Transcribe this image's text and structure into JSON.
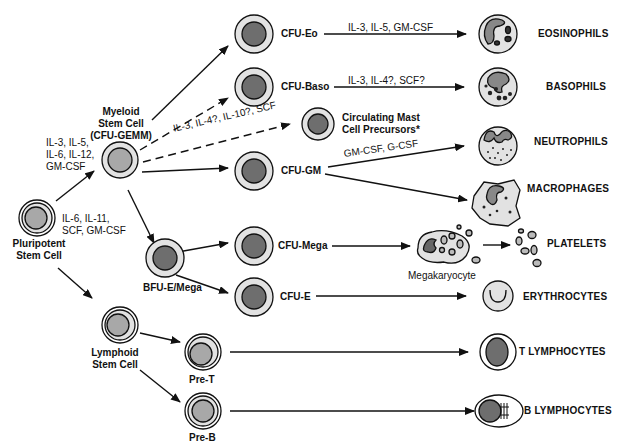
{
  "diagram": {
    "nodes": {
      "pluripotent": "Pluripotent\nStem Cell",
      "myeloid": "Myeloid\nStem Cell\n(CFU-GEMM)",
      "lymphoid": "Lymphoid\nStem Cell",
      "cfu_eo": "CFU-Eo",
      "cfu_baso": "CFU-Baso",
      "mast": "Circulating Mast\nCell Precursors*",
      "cfu_gm": "CFU-GM",
      "bfu_e_mega": "BFU-E/Mega",
      "cfu_mega": "CFU-Mega",
      "cfu_e": "CFU-E",
      "pre_t": "Pre-T",
      "pre_b": "Pre-B",
      "megakaryocyte": "Megakaryocyte"
    },
    "cytokines": {
      "to_myeloid": "IL-3, IL-5,\nIL-6, IL-12,\nGM-CSF",
      "pluripotent": "IL-6, IL-11,\nSCF, GM-CSF",
      "eo": "IL-3, IL-5, GM-CSF",
      "baso": "IL-3, IL-4?, SCF?",
      "mast": "IL-3, IL-4?, IL-10?, SCF",
      "gm": "GM-CSF, G-CSF"
    },
    "mature": {
      "eosinophils": "EOSINOPHILS",
      "basophils": "BASOPHILS",
      "neutrophils": "NEUTROPHILS",
      "macrophages": "MACROPHAGES",
      "platelets": "PLATELETS",
      "erythrocytes": "ERYTHROCYTES",
      "t_lymphocytes": "T LYMPHOCYTES",
      "b_lymphocytes": "B LYMPHOCYTES"
    },
    "colors": {
      "outer": "#e2e2e2",
      "inner_light": "#a8a8a8",
      "inner_dark": "#6e6e6e",
      "stroke": "#111111"
    }
  }
}
